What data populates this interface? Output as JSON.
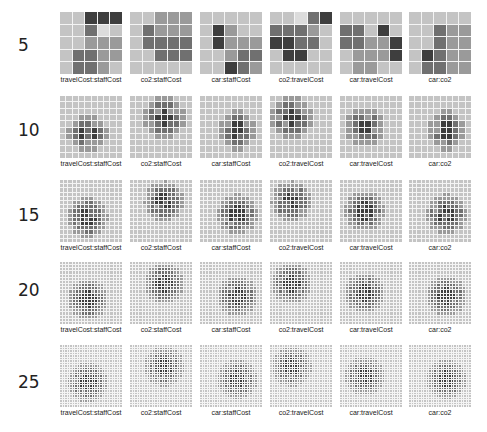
{
  "chart_data": {
    "type": "heatmap",
    "title": "",
    "row_labels": [
      "5",
      "10",
      "15",
      "20",
      "25"
    ],
    "column_labels": [
      "travelCost:staffCost",
      "co2:staffCost",
      "car:staffCost",
      "co2:travelCost",
      "car:travelCost",
      "car:co2"
    ],
    "grid_sizes": [
      5,
      10,
      15,
      20,
      25
    ],
    "colors": {
      "background": "#ffffff",
      "cell_light": "#c4c4c4",
      "cell_mid": "#8a8a8a",
      "cell_dark": "#3c3c3c",
      "gridline": "#f2f2f2"
    },
    "rows5": {
      "travelCost:staffCost": [
        [
          1,
          1,
          4,
          4,
          4
        ],
        [
          1,
          1,
          3,
          0,
          1
        ],
        [
          1,
          1,
          2,
          2,
          2
        ],
        [
          1,
          3,
          3,
          2,
          2
        ],
        [
          1,
          3,
          3,
          2,
          1
        ]
      ],
      "co2:staffCost": [
        [
          1,
          1,
          2,
          2,
          2
        ],
        [
          1,
          3,
          2,
          2,
          2
        ],
        [
          1,
          3,
          3,
          3,
          3
        ],
        [
          1,
          1,
          3,
          3,
          3
        ],
        [
          1,
          1,
          1,
          1,
          1
        ]
      ],
      "car:staffCost": [
        [
          1,
          1,
          1,
          1,
          1
        ],
        [
          1,
          4,
          2,
          1,
          1
        ],
        [
          1,
          4,
          2,
          2,
          2
        ],
        [
          1,
          1,
          2,
          3,
          3
        ],
        [
          1,
          1,
          4,
          3,
          2
        ]
      ],
      "co2:travelCost": [
        [
          1,
          1,
          0,
          3,
          4
        ],
        [
          3,
          3,
          3,
          2,
          1
        ],
        [
          4,
          4,
          3,
          3,
          1
        ],
        [
          1,
          4,
          4,
          1,
          1
        ],
        [
          1,
          1,
          1,
          1,
          1
        ]
      ],
      "car:travelCost": [
        [
          1,
          1,
          1,
          1,
          1
        ],
        [
          3,
          3,
          1,
          4,
          1
        ],
        [
          3,
          3,
          2,
          2,
          4
        ],
        [
          1,
          2,
          2,
          2,
          4
        ],
        [
          1,
          2,
          2,
          1,
          1
        ]
      ],
      "car:co2": [
        [
          1,
          1,
          1,
          1,
          1
        ],
        [
          1,
          1,
          3,
          2,
          2
        ],
        [
          1,
          1,
          3,
          2,
          2
        ],
        [
          1,
          4,
          3,
          2,
          2
        ],
        [
          1,
          3,
          3,
          2,
          2
        ]
      ]
    }
  },
  "row_labels": [
    "5",
    "10",
    "15",
    "20",
    "25"
  ],
  "captions": [
    "travelCost:staffCost",
    "co2:staffCost",
    "car:staffCost",
    "co2:travelCost",
    "car:travelCost",
    "car:co2"
  ]
}
